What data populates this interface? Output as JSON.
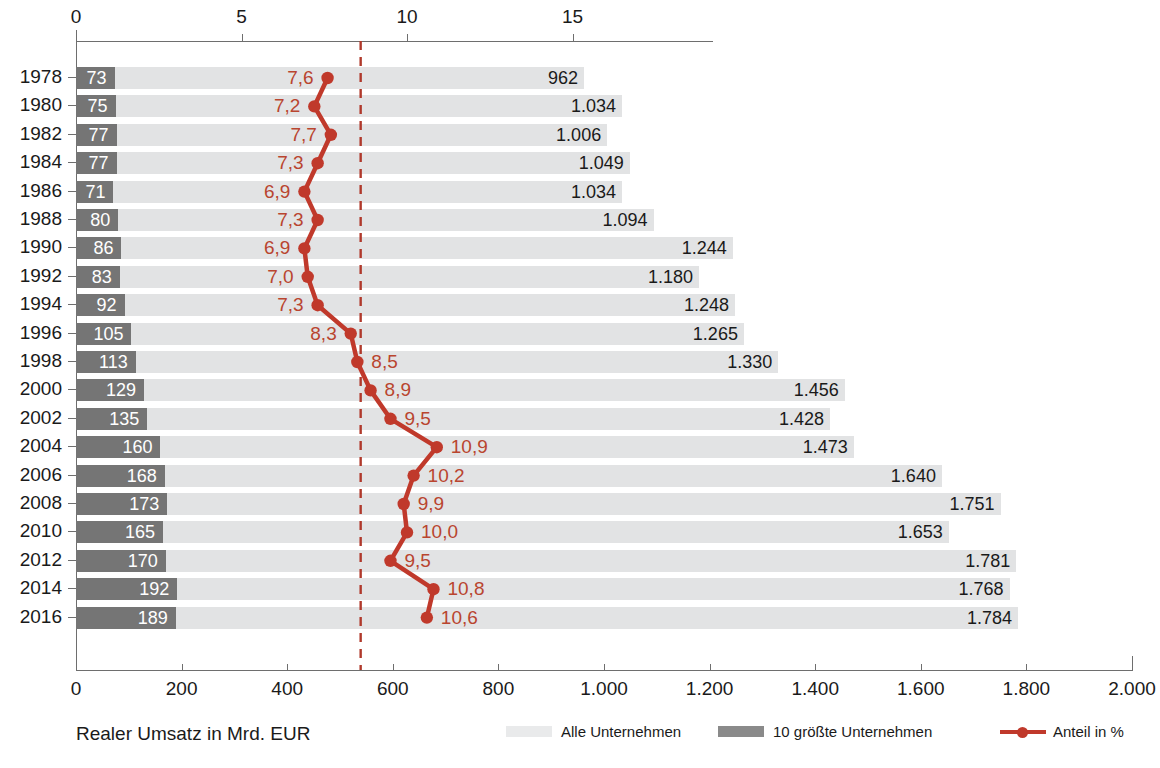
{
  "chart_data": {
    "type": "bar",
    "title": "",
    "subtitle": "",
    "xlabel": "Realer Umsatz in Mrd. EUR",
    "ylabel": "",
    "categories": [
      "1978",
      "1980",
      "1982",
      "1984",
      "1986",
      "1988",
      "1990",
      "1992",
      "1994",
      "1996",
      "1998",
      "2000",
      "2002",
      "2004",
      "2006",
      "2008",
      "2010",
      "2012",
      "2014",
      "2016"
    ],
    "bottom_axis": {
      "ticks": [
        0,
        200,
        400,
        600,
        800,
        1000,
        1200,
        1400,
        1600,
        1800,
        2000
      ],
      "tick_labels": [
        "0",
        "200",
        "400",
        "600",
        "800",
        "1.000",
        "1.200",
        "1.400",
        "1.600",
        "1.800",
        "2.000"
      ],
      "range": [
        0,
        2000
      ],
      "label": "Realer Umsatz in Mrd. EUR"
    },
    "top_axis": {
      "ticks": [
        0,
        5,
        10,
        15
      ],
      "tick_labels": [
        "0",
        "5",
        "10",
        "15"
      ],
      "range": [
        0,
        19.7
      ],
      "label": "Anteil in %"
    },
    "grid": false,
    "legend_position": "bottom",
    "reference_line": {
      "value": 8.6,
      "axis": "top",
      "style": "dashed",
      "color": "#b0392b"
    },
    "series": [
      {
        "name": "Alle Unternehmen",
        "axis": "bottom",
        "color": "#e2e3e4",
        "values": [
          962,
          1034,
          1006,
          1049,
          1034,
          1094,
          1244,
          1180,
          1248,
          1265,
          1330,
          1456,
          1428,
          1473,
          1640,
          1751,
          1653,
          1781,
          1768,
          1784
        ],
        "labels": [
          "962",
          "1.034",
          "1.006",
          "1.049",
          "1.034",
          "1.094",
          "1.244",
          "1.180",
          "1.248",
          "1.265",
          "1.330",
          "1.456",
          "1.428",
          "1.473",
          "1.640",
          "1.751",
          "1.653",
          "1.781",
          "1.768",
          "1.784"
        ]
      },
      {
        "name": "10 größte Unternehmen",
        "axis": "bottom",
        "color": "#757575",
        "values": [
          73,
          75,
          77,
          77,
          71,
          80,
          86,
          83,
          92,
          105,
          113,
          129,
          135,
          160,
          168,
          173,
          165,
          170,
          192,
          189
        ],
        "labels": [
          "73",
          "75",
          "77",
          "77",
          "71",
          "80",
          "86",
          "83",
          "92",
          "105",
          "113",
          "129",
          "135",
          "160",
          "168",
          "173",
          "165",
          "170",
          "192",
          "189"
        ]
      },
      {
        "name": "Anteil in %",
        "axis": "top",
        "color": "#c0392b",
        "values": [
          7.6,
          7.2,
          7.7,
          7.3,
          6.9,
          7.3,
          6.9,
          7.0,
          7.3,
          8.3,
          8.5,
          8.9,
          9.5,
          10.9,
          10.2,
          9.9,
          10.0,
          9.5,
          10.8,
          10.6
        ],
        "labels": [
          "7,6",
          "7,2",
          "7,7",
          "7,3",
          "6,9",
          "7,3",
          "6,9",
          "7,0",
          "7,3",
          "8,3",
          "8,5",
          "8,9",
          "9,5",
          "10,9",
          "10,2",
          "9,9",
          "10,0",
          "9,5",
          "10,8",
          "10,6"
        ],
        "label_side": [
          "left",
          "left",
          "left",
          "left",
          "left",
          "left",
          "left",
          "left",
          "left",
          "left",
          "right",
          "right",
          "right",
          "right",
          "right",
          "right",
          "right",
          "right",
          "right",
          "right"
        ]
      }
    ]
  },
  "legend": {
    "items": [
      {
        "label": "Alle Unternehmen",
        "marker": "swatch-light"
      },
      {
        "label": "10 größte Unternehmen",
        "marker": "swatch-dark"
      },
      {
        "label": "Anteil in %",
        "marker": "line-marker"
      }
    ]
  },
  "colors": {
    "bar_all": "#e2e3e4",
    "bar_top10": "#757575",
    "line": "#c0392b",
    "reference_line": "#b0392b",
    "axis": "#6e6e6e",
    "text": "#1a1a1a"
  }
}
